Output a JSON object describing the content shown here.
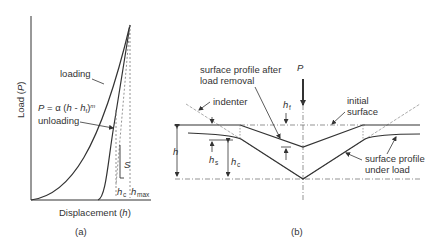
{
  "panel_a": {
    "caption": "(a)",
    "y_axis_label_prefix": "Load (",
    "y_axis_label_var": "P",
    "y_axis_label_suffix": ")",
    "x_axis_label_prefix": "Displacement (",
    "x_axis_label_var": "h",
    "x_axis_label_suffix": ")",
    "loading_label": "loading",
    "unloading_label": "unloading",
    "equation": {
      "lhs": "P",
      "eq": " = α (",
      "h": "h",
      "minus": " - ",
      "hf": "h",
      "hf_sub": "f",
      "close": ")",
      "exp": "m"
    },
    "stiffness_label": "S",
    "hc_label": "h",
    "hc_sub": "c",
    "hmax_label": "h",
    "hmax_sub": "max"
  },
  "panel_b": {
    "caption": "(b)",
    "load_label": "P",
    "indenter_label": "indenter",
    "after_removal_line1": "surface profile after",
    "after_removal_line2": "load removal",
    "initial_surface_line1": "initial",
    "initial_surface_line2": "surface",
    "under_load_line1": "surface profile",
    "under_load_line2": "under load",
    "h_label": "h",
    "hs_label": "h",
    "hs_sub": "s",
    "hc_label": "h",
    "hc_sub": "c",
    "hf_label": "h",
    "hf_sub": "f"
  },
  "colors": {
    "line": "#333333",
    "text": "#333333",
    "dash": "#666666"
  }
}
